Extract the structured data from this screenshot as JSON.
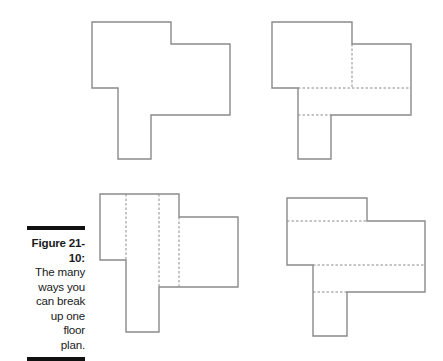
{
  "figure": {
    "label": "Figure 21-10:",
    "caption_lines": [
      "The many",
      "ways you",
      "can break",
      "up one floor",
      "plan."
    ]
  },
  "colors": {
    "outline": "#8a8a8a",
    "divider": "#8a8a8a",
    "bar": "#111111"
  },
  "floor_plans": [
    {
      "name": "plan-original",
      "outline": "92,22 171,22 171,44 230,44 230,115 151,115 151,159 118,159 118,88 92,88",
      "dividers": []
    },
    {
      "name": "plan-horizontal-split",
      "outline": "272,22 352,22 352,44 411,44 411,115 331,115 331,159 298,159 298,88 272,88",
      "dividers": [
        "352,44 352,88",
        "298,88 411,88",
        "298,115 331,115"
      ]
    },
    {
      "name": "plan-vertical-split",
      "outline": "100,194 179,194 179,217 238,217 238,287 159,287 159,332 126,332 126,260 100,260",
      "dividers": [
        "126,194 126,260",
        "159,194 159,287",
        "179,217 179,287"
      ]
    },
    {
      "name": "plan-strip-split",
      "outline": "287,198 367,198 367,221 425,221 425,292 347,292 347,336 313,336 313,265 287,265",
      "dividers": [
        "287,221 367,221",
        "313,265 425,265",
        "313,292 347,292"
      ]
    }
  ]
}
